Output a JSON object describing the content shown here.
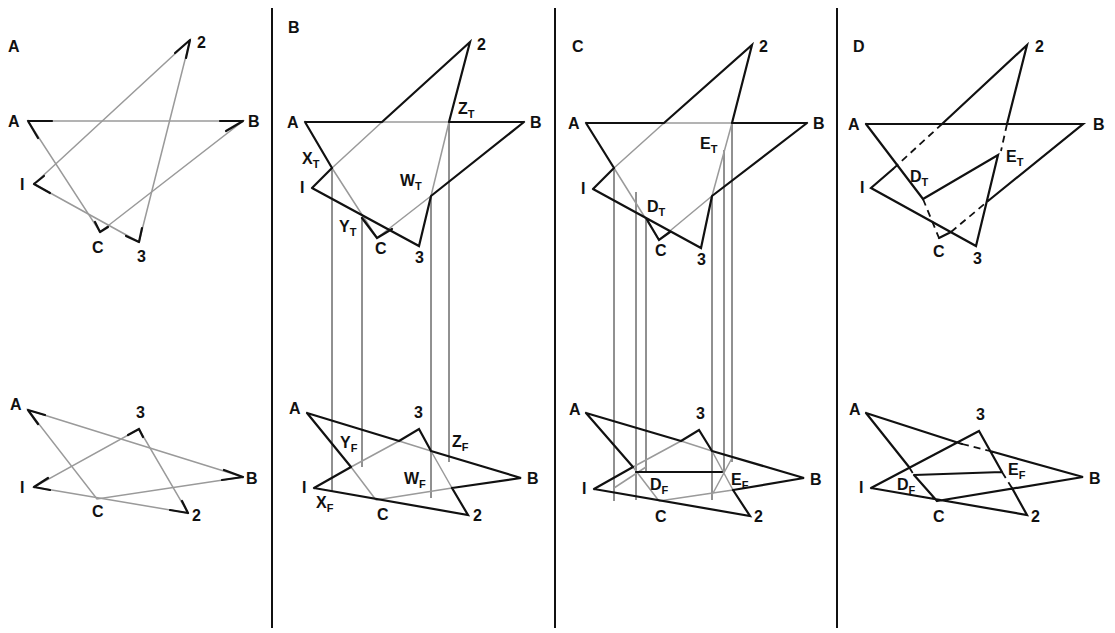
{
  "figure": {
    "colors": {
      "visible_line": "#111111",
      "construction_line": "#9a9a9a",
      "background": "#ffffff"
    },
    "panels": [
      {
        "id": "A",
        "title": "A",
        "top_view_labels": [
          "A",
          "B",
          "C",
          "I",
          "2",
          "3"
        ],
        "front_view_labels": [
          "A",
          "B",
          "C",
          "I",
          "2",
          "3"
        ]
      },
      {
        "id": "B",
        "title": "B",
        "top_view_labels": [
          "A",
          "B",
          "C",
          "I",
          "2",
          "3"
        ],
        "top_view_points": [
          {
            "base": "X",
            "sub": "T"
          },
          {
            "base": "Y",
            "sub": "T"
          },
          {
            "base": "W",
            "sub": "T"
          },
          {
            "base": "Z",
            "sub": "T"
          }
        ],
        "front_view_labels": [
          "A",
          "B",
          "C",
          "I",
          "2",
          "3"
        ],
        "front_view_points": [
          {
            "base": "X",
            "sub": "F"
          },
          {
            "base": "Y",
            "sub": "F"
          },
          {
            "base": "W",
            "sub": "F"
          },
          {
            "base": "Z",
            "sub": "F"
          }
        ]
      },
      {
        "id": "C",
        "title": "C",
        "top_view_labels": [
          "A",
          "B",
          "C",
          "I",
          "2",
          "3"
        ],
        "top_view_points": [
          {
            "base": "D",
            "sub": "T"
          },
          {
            "base": "E",
            "sub": "T"
          }
        ],
        "front_view_labels": [
          "A",
          "B",
          "C",
          "I",
          "2",
          "3"
        ],
        "front_view_points": [
          {
            "base": "D",
            "sub": "F"
          },
          {
            "base": "E",
            "sub": "F"
          }
        ]
      },
      {
        "id": "D",
        "title": "D",
        "top_view_labels": [
          "A",
          "B",
          "C",
          "I",
          "2",
          "3"
        ],
        "top_view_points": [
          {
            "base": "D",
            "sub": "T"
          },
          {
            "base": "E",
            "sub": "T"
          }
        ],
        "front_view_labels": [
          "A",
          "B",
          "C",
          "I",
          "2",
          "3"
        ],
        "front_view_points": [
          {
            "base": "D",
            "sub": "F"
          },
          {
            "base": "E",
            "sub": "F"
          }
        ]
      }
    ]
  }
}
